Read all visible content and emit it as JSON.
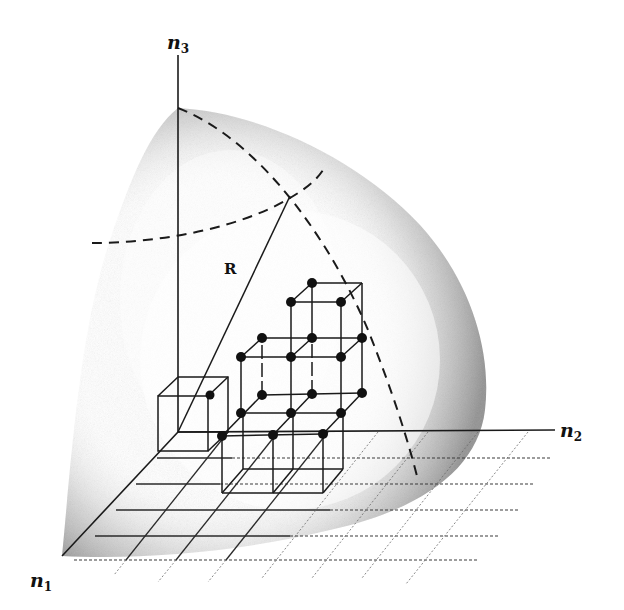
{
  "figure": {
    "colors": {
      "ink": "#1a1a1a",
      "shading": "#9a9a9a",
      "background": "#ffffff"
    },
    "axes": {
      "n1": {
        "label": "n",
        "subscript": "1"
      },
      "n2": {
        "label": "n",
        "subscript": "2"
      },
      "n3": {
        "label": "n",
        "subscript": "3"
      }
    },
    "radius_label": "R",
    "elements": {
      "sphere_octant": "shaded eighth of sphere",
      "meridian_arc": "dashed arc from n3 pole down to n1-n2 plane",
      "latitude_arc": "dashed horizontal arc crossing n3 axis",
      "radius_line": "solid line from origin to sphere surface",
      "unit_cube": "single unit cell at the origin",
      "lattice_block": "2x2x1 block of unit cells with 1x1x1 cell stacked on top, lattice points marked",
      "floor_grid": "square grid in the n1-n2 plane"
    }
  }
}
